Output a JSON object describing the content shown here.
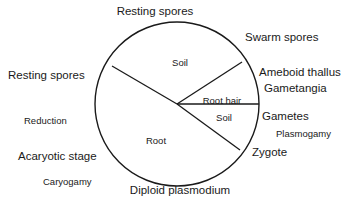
{
  "diagram": {
    "type": "life-cycle-circle",
    "geometry": {
      "circle": {
        "cx": 177,
        "cy": 104,
        "r": 82
      },
      "stroke_color": "#1a1a1a",
      "stroke_width": 1.3,
      "radial_lines": [
        {
          "name": "upper-left-radius",
          "x2": 112,
          "y2": 66
        },
        {
          "name": "lower-right-radius",
          "x2": 240,
          "y2": 150
        },
        {
          "name": "upper-right-radius",
          "x2": 242,
          "y2": 62
        },
        {
          "name": "horizontal-radius",
          "x2": 259,
          "y2": 104
        }
      ]
    },
    "interior_labels": [
      {
        "name": "soil-upper",
        "text": "Soil",
        "x": 180,
        "y": 63
      },
      {
        "name": "root-hair",
        "text": "Root hair",
        "x": 222,
        "y": 101
      },
      {
        "name": "soil-lower",
        "text": "Soil",
        "x": 224,
        "y": 118
      },
      {
        "name": "root",
        "text": "Root",
        "x": 156,
        "y": 141
      }
    ],
    "exterior_labels": [
      {
        "name": "resting-spores-top",
        "text": "Resting spores",
        "x": 155,
        "y": 12,
        "align": "center",
        "kind": "outer"
      },
      {
        "name": "swarm-spores",
        "text": "Swarm spores",
        "x": 245,
        "y": 38,
        "align": "left",
        "kind": "outer"
      },
      {
        "name": "ameboid-thallus",
        "text": "Ameboid thallus",
        "x": 259,
        "y": 73,
        "align": "left",
        "kind": "outer"
      },
      {
        "name": "gametangia",
        "text": "Gametangia",
        "x": 264,
        "y": 89,
        "align": "left",
        "kind": "outer"
      },
      {
        "name": "gametes",
        "text": "Gametes",
        "x": 262,
        "y": 117,
        "align": "left",
        "kind": "outer"
      },
      {
        "name": "plasmogamy",
        "text": "Plasmogamy",
        "x": 276,
        "y": 134,
        "align": "left",
        "kind": "process"
      },
      {
        "name": "zygote",
        "text": "Zygote",
        "x": 252,
        "y": 153,
        "align": "left",
        "kind": "outer"
      },
      {
        "name": "diploid-plasmodium",
        "text": "Diploid plasmodium",
        "x": 180,
        "y": 190,
        "align": "center",
        "kind": "outer"
      },
      {
        "name": "caryogamy",
        "text": "Caryogamy",
        "x": 43,
        "y": 182,
        "align": "left",
        "kind": "process"
      },
      {
        "name": "acaryotic-stage",
        "text": "Acaryotic stage",
        "x": 18,
        "y": 157,
        "align": "left",
        "kind": "outer"
      },
      {
        "name": "reduction",
        "text": "Reduction",
        "x": 24,
        "y": 121,
        "align": "left",
        "kind": "process"
      },
      {
        "name": "resting-spores-left",
        "text": "Resting spores",
        "x": 8,
        "y": 76,
        "align": "left",
        "kind": "outer"
      }
    ]
  }
}
